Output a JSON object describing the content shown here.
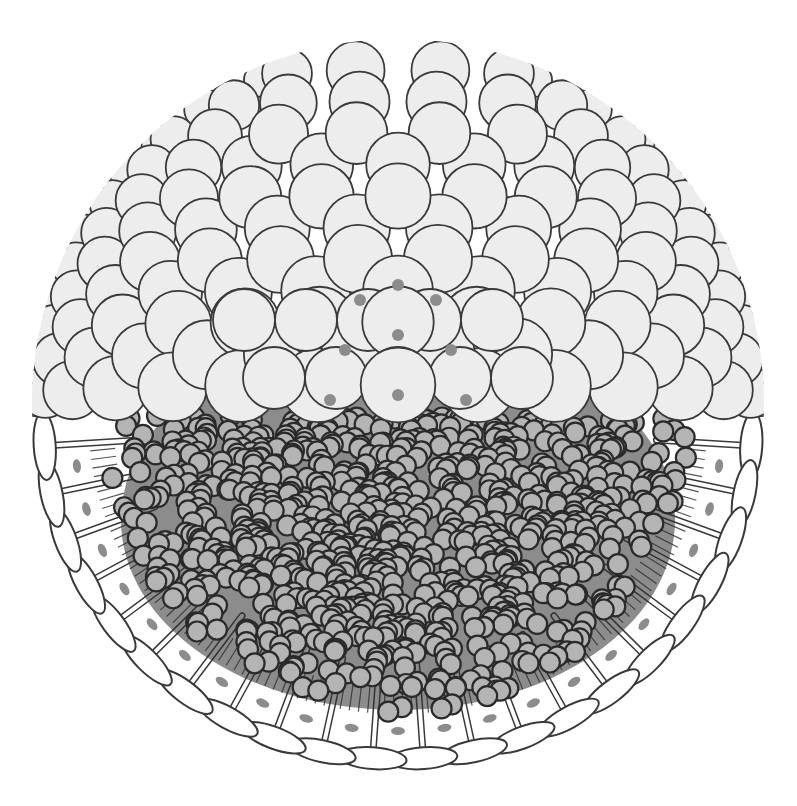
{
  "figure": {
    "title": "",
    "canvas": {
      "width": 797,
      "height": 806,
      "background": "#ffffff"
    },
    "sphere": {
      "cx": 398,
      "cy": 405,
      "r": 362
    },
    "equator_y": 425,
    "colors": {
      "outline": "#3a3a3a",
      "cell_fill": "#ededed",
      "cell_highlight": "#f6f6f6",
      "granule_fill": "#b4b4b4",
      "granule_stroke": "#2a2a2a",
      "dark_mass": "#2e2e2e",
      "interstitial_dot": "#8c8c8c",
      "projection_fill": "#ffffff"
    },
    "upper_cells": {
      "label": "blastomeres",
      "base_radius": 33,
      "rows": 11
    },
    "granules": {
      "label": "yolk granules",
      "radius": 10,
      "count": 900
    },
    "projections": {
      "label": "peripheral projections",
      "count": 22
    }
  }
}
